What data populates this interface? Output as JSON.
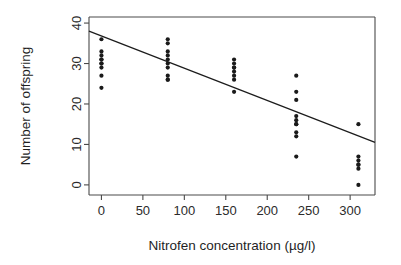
{
  "chart_data": {
    "type": "scatter",
    "title": "",
    "xlabel": "Nitrofen concentration (µg/l)",
    "ylabel": "Number of offspring",
    "xlim": [
      -15,
      330
    ],
    "ylim": [
      -2.5,
      41.5
    ],
    "xticks": [
      0,
      50,
      100,
      150,
      200,
      250,
      300
    ],
    "xticklabels": [
      "0",
      "50",
      "100",
      "150",
      "200",
      "250",
      "300"
    ],
    "yticks": [
      0,
      10,
      20,
      30,
      40
    ],
    "yticklabels": [
      "0",
      "10",
      "20",
      "30",
      "40"
    ],
    "grid": false,
    "legend": false,
    "marker": "filled-circle",
    "marker_color": "#1a1a1a",
    "points": [
      {
        "x": 0,
        "y": 36
      },
      {
        "x": 0,
        "y": 33
      },
      {
        "x": 0,
        "y": 32
      },
      {
        "x": 0,
        "y": 31
      },
      {
        "x": 0,
        "y": 31
      },
      {
        "x": 0,
        "y": 30
      },
      {
        "x": 0,
        "y": 30
      },
      {
        "x": 0,
        "y": 29
      },
      {
        "x": 0,
        "y": 27
      },
      {
        "x": 0,
        "y": 24
      },
      {
        "x": 80,
        "y": 36
      },
      {
        "x": 80,
        "y": 35
      },
      {
        "x": 80,
        "y": 33
      },
      {
        "x": 80,
        "y": 32
      },
      {
        "x": 80,
        "y": 31
      },
      {
        "x": 80,
        "y": 30
      },
      {
        "x": 80,
        "y": 29
      },
      {
        "x": 80,
        "y": 27
      },
      {
        "x": 80,
        "y": 26
      },
      {
        "x": 80,
        "y": 26
      },
      {
        "x": 160,
        "y": 31
      },
      {
        "x": 160,
        "y": 30
      },
      {
        "x": 160,
        "y": 29
      },
      {
        "x": 160,
        "y": 29
      },
      {
        "x": 160,
        "y": 28
      },
      {
        "x": 160,
        "y": 27
      },
      {
        "x": 160,
        "y": 26
      },
      {
        "x": 160,
        "y": 23
      },
      {
        "x": 235,
        "y": 27
      },
      {
        "x": 235,
        "y": 23
      },
      {
        "x": 235,
        "y": 21
      },
      {
        "x": 235,
        "y": 17
      },
      {
        "x": 235,
        "y": 16
      },
      {
        "x": 235,
        "y": 15
      },
      {
        "x": 235,
        "y": 15
      },
      {
        "x": 235,
        "y": 13
      },
      {
        "x": 235,
        "y": 12
      },
      {
        "x": 235,
        "y": 7
      },
      {
        "x": 310,
        "y": 15
      },
      {
        "x": 310,
        "y": 7
      },
      {
        "x": 310,
        "y": 6
      },
      {
        "x": 310,
        "y": 5
      },
      {
        "x": 310,
        "y": 5
      },
      {
        "x": 310,
        "y": 4
      },
      {
        "x": 310,
        "y": 0
      }
    ],
    "fit_line": {
      "name": "linear regression",
      "x_start": -15,
      "y_start": 38.0,
      "x_end": 330,
      "y_end": 10.5,
      "color": "#1c1c1c"
    }
  }
}
